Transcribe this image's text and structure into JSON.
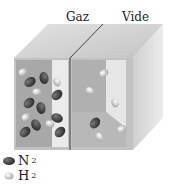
{
  "labels": {
    "gas": "Gaz",
    "vacuum": "Vide"
  },
  "legend": [
    {
      "icon": "n2-molecule-icon",
      "label": "N",
      "sub": "2",
      "color": "#3a3a3a"
    },
    {
      "icon": "h2-molecule-icon",
      "label": "H",
      "sub": "2",
      "color": "#f2f2f2"
    }
  ],
  "colors": {
    "top_face": "#cfcfcf",
    "front_face": "#bdbdbd",
    "side_face": "#d8d8d8",
    "cavity_dark": "#a9a9a9",
    "cavity_light": "#e9e9e9",
    "n2": "#3a3a3a",
    "h2": "#f0f0f0"
  }
}
